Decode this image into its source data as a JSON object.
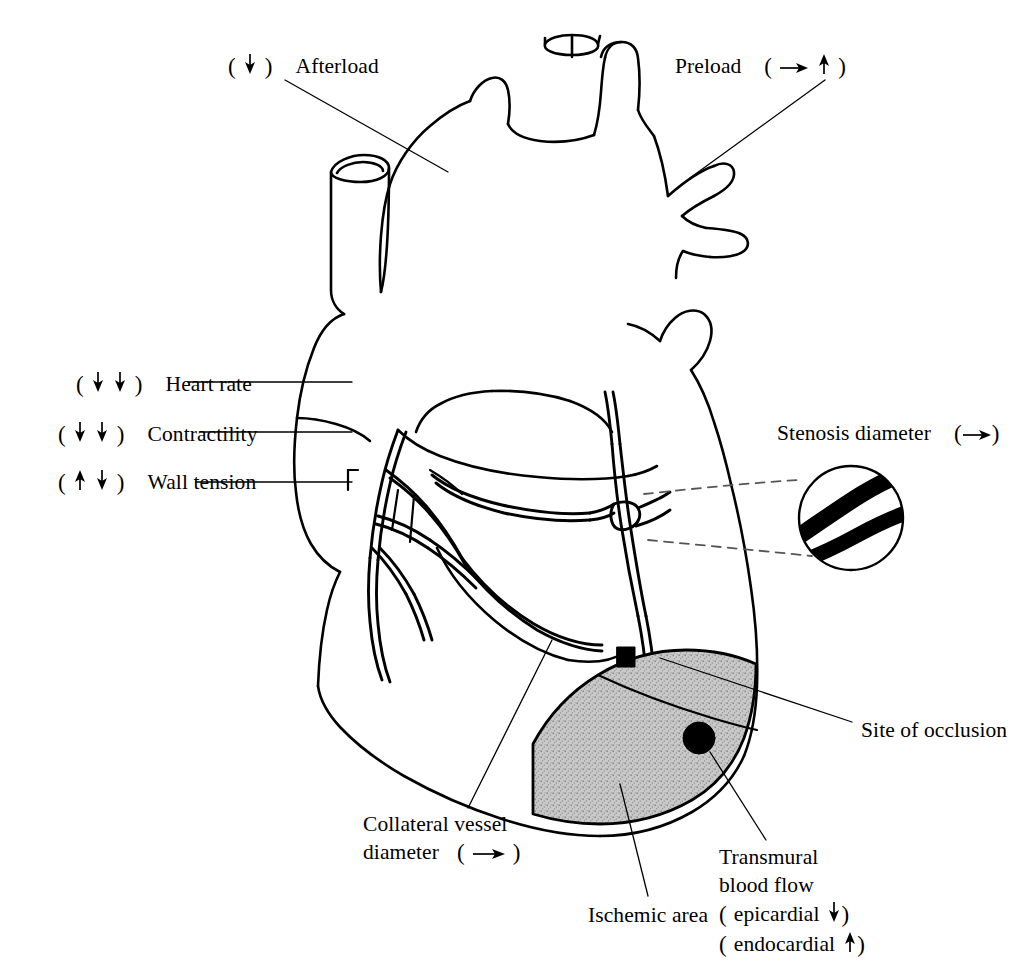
{
  "figure": {
    "background_color": "#ffffff",
    "ink_color": "#000000",
    "ischemic_area_fill": "#b8b8b8"
  },
  "labels": {
    "afterload": {
      "text": "Afterload",
      "arrows": [
        "down"
      ],
      "arrow_position": "before"
    },
    "preload": {
      "text": "Preload",
      "arrows": [
        "right",
        "up"
      ],
      "arrow_position": "after"
    },
    "heart_rate": {
      "text": "Heart rate",
      "arrows": [
        "down",
        "down"
      ],
      "arrow_position": "before"
    },
    "contractility": {
      "text": "Contractility",
      "arrows": [
        "down",
        "down"
      ],
      "arrow_position": "before"
    },
    "wall_tension": {
      "text": "Wall tension",
      "arrows": [
        "up",
        "down"
      ],
      "arrow_position": "before"
    },
    "stenosis_diameter": {
      "text": "Stenosis diameter",
      "arrows": [
        "right"
      ],
      "arrow_position": "after"
    },
    "site_of_occlusion": {
      "text": "Site of occlusion",
      "arrows": [],
      "arrow_position": "none"
    },
    "collateral_vessel": {
      "line1": "Collateral vessel",
      "line2": "diameter",
      "arrows": [
        "right"
      ],
      "arrow_position": "after"
    },
    "ischemic_area": {
      "text": "Ischemic area",
      "arrows": [],
      "arrow_position": "none"
    },
    "transmural_blood_flow": {
      "line1": "Transmural",
      "line2": "blood flow",
      "line3_text": "epicardial",
      "line3_arrow": "down",
      "line4_text": "endocardial",
      "line4_arrow": "up"
    }
  },
  "diagram_elements": {
    "heart": "anatomical-heart-outline",
    "great_vessels": "aorta-pulmonary-artery-vena-cava",
    "coronary_arteries": "left-and-right-coronary-branches",
    "stenosis_marker": "narrowed-vessel-bulge",
    "stenosis_inset": "magnified-circle-showing-narrowed-lumen",
    "occlusion_marker": "black-square",
    "transmural_marker": "black-circle",
    "ischemic_region": "gray-stippled-ventricle-region"
  }
}
